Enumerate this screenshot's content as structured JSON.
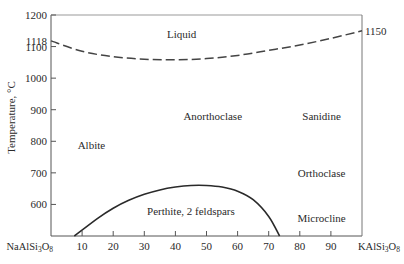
{
  "chart_data": {
    "type": "line",
    "title": "",
    "xlabel_left": "NaAlSi3O8",
    "xlabel_right": "KAlSi3O8",
    "ylabel": "Temperature, °C",
    "xlim": [
      0,
      100
    ],
    "ylim": [
      500,
      1200
    ],
    "x_ticks": [
      10,
      20,
      30,
      40,
      50,
      60,
      70,
      80,
      90
    ],
    "y_ticks": [
      600,
      700,
      800,
      900,
      1000,
      1100,
      1200
    ],
    "y_extra_labels": [
      {
        "value": 1118,
        "side": "left",
        "label": "1118"
      },
      {
        "value": 1150,
        "side": "right",
        "label": "1150"
      }
    ],
    "grid": false,
    "series": [
      {
        "name": "Liquidus / solidus (dashed)",
        "style": "dashed",
        "x": [
          0,
          10,
          20,
          30,
          40,
          50,
          60,
          70,
          80,
          90,
          100
        ],
        "y": [
          1118,
          1085,
          1068,
          1060,
          1058,
          1062,
          1072,
          1088,
          1105,
          1126,
          1150
        ]
      },
      {
        "name": "Solvus (perthite field boundary)",
        "style": "solid",
        "x": [
          7.5,
          15,
          20,
          25,
          30,
          35,
          40,
          45,
          50,
          55,
          60,
          65,
          70,
          73.5
        ],
        "y": [
          500,
          556,
          588,
          613,
          632,
          646,
          655,
          660,
          660,
          655,
          642,
          615,
          562,
          500
        ]
      }
    ],
    "annotations": [
      {
        "text": "Liquid",
        "x": 42,
        "y": 1140
      },
      {
        "text": "Anorthoclase",
        "x": 52,
        "y": 880
      },
      {
        "text": "Sanidine",
        "x": 87,
        "y": 880
      },
      {
        "text": "Albite",
        "x": 13,
        "y": 787
      },
      {
        "text": "Orthoclase",
        "x": 87,
        "y": 700
      },
      {
        "text": "Perthite, 2 feldspars",
        "x": 45,
        "y": 580
      },
      {
        "text": "Microcline",
        "x": 87,
        "y": 557
      }
    ]
  }
}
